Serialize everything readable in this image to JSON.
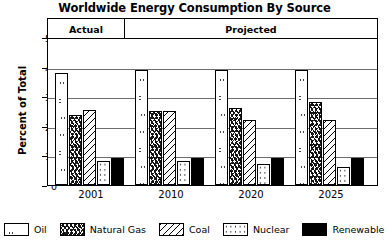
{
  "chart_data": {
    "type": "bar",
    "title": "Worldwide Energy Consumption By Source",
    "xlabel": "",
    "ylabel": "Percent of Total",
    "ylim": [
      0,
      50
    ],
    "yticks": [
      0,
      10,
      20,
      30,
      40,
      50
    ],
    "grid": true,
    "legend_position": "bottom",
    "categories": [
      "2001",
      "2010",
      "2020",
      "2025"
    ],
    "series": [
      {
        "name": "Oil",
        "pattern": "outlined-blobs",
        "values": [
          38,
          39,
          39,
          39
        ]
      },
      {
        "name": "Natural Gas",
        "pattern": "dense-scribble",
        "values": [
          23.5,
          25,
          26,
          28
        ]
      },
      {
        "name": "Coal",
        "pattern": "diagonal-hatch",
        "values": [
          25.5,
          25,
          22,
          22
        ]
      },
      {
        "name": "Nuclear",
        "pattern": "fine-dots",
        "values": [
          8,
          8,
          7,
          6
        ]
      },
      {
        "name": "Renewable",
        "pattern": "solid-black",
        "values": [
          9,
          9,
          9,
          9
        ]
      }
    ],
    "annotations": [
      {
        "label": "Actual",
        "covers": [
          "2001"
        ]
      },
      {
        "label": "Projected",
        "covers": [
          "2010",
          "2020",
          "2025"
        ]
      }
    ]
  },
  "legend": {
    "items": [
      {
        "label": "Oil"
      },
      {
        "label": "Natural Gas"
      },
      {
        "label": "Coal"
      },
      {
        "label": "Nuclear"
      },
      {
        "label": "Renewable"
      }
    ]
  },
  "colors": {
    "ink": "#000000",
    "gridline": "#6f6f6f",
    "background": "#ffffff"
  }
}
